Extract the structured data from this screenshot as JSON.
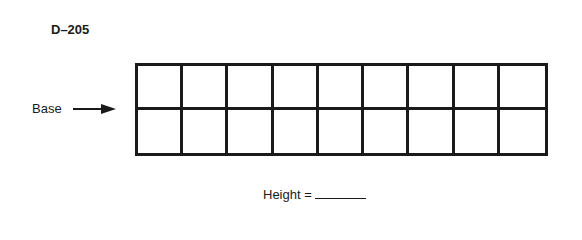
{
  "document": {
    "problem_id": "D–205",
    "base_label": "Base",
    "arrow_icon": "right-arrow-icon",
    "grid": {
      "rows": 2,
      "columns": 9
    },
    "height_label": "Height =",
    "height_answer": ""
  },
  "colors": {
    "ink": "#1a1a1a",
    "background": "#ffffff"
  }
}
